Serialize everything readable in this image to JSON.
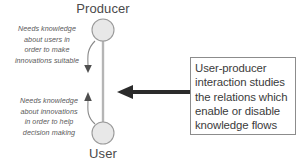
{
  "diagram": {
    "title": "User-producer interaction",
    "nodes": [
      {
        "id": "producer",
        "label": "Producer",
        "shape": "circle",
        "fill": "#e8e8e8",
        "stroke": "#9a9a9a"
      },
      {
        "id": "user",
        "label": "User",
        "shape": "circle",
        "fill": "#e8e8e8",
        "stroke": "#9a9a9a"
      }
    ],
    "annotations": {
      "producer_to_user": {
        "lines": [
          "Needs knowledge",
          "about users in",
          "order to make",
          "innovations suitable"
        ]
      },
      "user_to_producer": {
        "lines": [
          "Needs knowledge",
          "about innovations",
          "in order to help",
          "decision making"
        ]
      }
    },
    "callout": {
      "lines": [
        "User-producer",
        "interaction studies",
        "the relations which",
        "enable or disable",
        "knowledge flows"
      ],
      "border_color": "#8c8c8c",
      "background": "#ffffff"
    },
    "pointer_arrow": {
      "direction": "left",
      "color": "#2b2b2b"
    },
    "colors": {
      "node_fill": "#e8e8e8",
      "node_stroke": "#9a9a9a",
      "connector": "#b0b0b0",
      "curve_arrow": "#6b6b6b",
      "text": "#4a4a4a",
      "background": "#ffffff"
    }
  }
}
